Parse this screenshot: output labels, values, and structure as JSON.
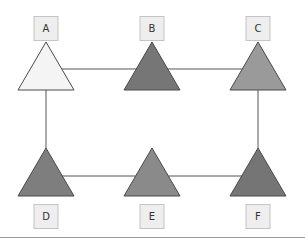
{
  "diagram": {
    "type": "network-graph",
    "canvas": {
      "width": 305,
      "height": 240,
      "background": "#ffffff"
    },
    "style": {
      "edge_color": "#555555",
      "triangle_stroke": "#4a4a4a",
      "label_box_fill": "#eeeeee",
      "label_box_stroke": "#c4c4c4",
      "label_text_color": "#333333",
      "bottom_rule_color": "#9a9a9a"
    },
    "nodes": [
      {
        "id": "A",
        "label": "A",
        "cx": 46,
        "row": "top",
        "fill": "#f4f4f4"
      },
      {
        "id": "B",
        "label": "B",
        "cx": 152,
        "row": "top",
        "fill": "#767676"
      },
      {
        "id": "C",
        "label": "C",
        "cx": 258,
        "row": "top",
        "fill": "#9a9a9a"
      },
      {
        "id": "D",
        "label": "D",
        "cx": 46,
        "row": "bottom",
        "fill": "#7e7e7e"
      },
      {
        "id": "E",
        "label": "E",
        "cx": 152,
        "row": "bottom",
        "fill": "#8a8a8a"
      },
      {
        "id": "F",
        "label": "F",
        "cx": 258,
        "row": "bottom",
        "fill": "#757575"
      }
    ],
    "edges": [
      {
        "from": "A",
        "to": "B"
      },
      {
        "from": "B",
        "to": "C"
      },
      {
        "from": "A",
        "to": "D"
      },
      {
        "from": "C",
        "to": "F"
      },
      {
        "from": "D",
        "to": "E"
      },
      {
        "from": "E",
        "to": "F"
      }
    ]
  }
}
